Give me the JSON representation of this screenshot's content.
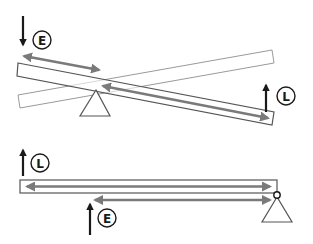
{
  "diagram": {
    "colors": {
      "beam_stroke": "#555555",
      "ghost_stroke": "#9a9a9a",
      "arm_arrow": "#7a7a7a",
      "force_arrow": "#1a1a1a",
      "label_stroke": "#1a1a1a",
      "background": "#ffffff"
    },
    "top_lever": {
      "type": "first-class lever",
      "effort": {
        "label": "E",
        "direction": "down"
      },
      "load": {
        "label": "L",
        "direction": "up"
      },
      "effort_arm": "short double-headed arrow (left of fulcrum)",
      "load_arm": "long double-headed arrow (right of fulcrum)",
      "fulcrum": "triangle under beam, left-of-center",
      "ghost_beam": "outline of lever in opposite tilt"
    },
    "bottom_lever": {
      "type": "third-class lever",
      "load": {
        "label": "L",
        "direction": "up"
      },
      "effort": {
        "label": "E",
        "direction": "up"
      },
      "load_arm": "full-length double-headed arrow inside beam",
      "effort_arm": "shorter double-headed arrow below beam",
      "fulcrum": "triangle with pivot circle at right end"
    }
  }
}
